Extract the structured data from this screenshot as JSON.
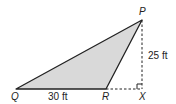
{
  "diagram": {
    "title": "",
    "shape": "triangle",
    "fill_color": "#d9d9d9",
    "stroke_color": "#222222",
    "points": {
      "P": {
        "label": "P",
        "x": 142,
        "y": 20
      },
      "Q": {
        "label": "Q",
        "x": 16,
        "y": 89
      },
      "R": {
        "label": "R",
        "x": 106,
        "y": 89
      },
      "X": {
        "label": "X",
        "x": 142,
        "y": 89
      }
    },
    "measurements": {
      "QR": "30 ft",
      "PX": "25 ft"
    },
    "annotations": {
      "right_angle_at": "X",
      "dashed_segments": [
        "RX",
        "PX"
      ]
    }
  }
}
